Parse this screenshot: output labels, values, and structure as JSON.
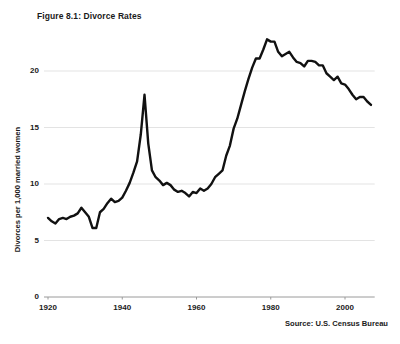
{
  "figure": {
    "title": "Figure 8.1: Divorce Rates",
    "source": "Source: U.S. Census Bureau",
    "background_color": "#ffffff",
    "line_color": "#111111",
    "gridline_color": "#e3e3e3",
    "text_color": "#1a1a1a"
  },
  "chart_data": {
    "type": "line",
    "title": "Figure 8.1: Divorce Rates",
    "xlabel": "",
    "ylabel": "Divorces per 1,000 married women",
    "xlim": [
      1920,
      2008
    ],
    "ylim": [
      0,
      23.5
    ],
    "xticks": [
      1920,
      1940,
      1960,
      1980,
      2000
    ],
    "yticks": [
      0,
      5,
      10,
      15,
      20
    ],
    "xtick_labels": [
      "1920",
      "1940",
      "1960",
      "1980",
      "2000"
    ],
    "ytick_labels": [
      "0",
      "5",
      "10",
      "15",
      "20"
    ],
    "grid": "horizontal",
    "legend": null,
    "annotations": [
      "Source: U.S. Census Bureau"
    ],
    "series": [
      {
        "name": "Divorce rate",
        "x": [
          1920,
          1921,
          1922,
          1923,
          1924,
          1925,
          1926,
          1927,
          1928,
          1929,
          1930,
          1931,
          1932,
          1933,
          1934,
          1935,
          1936,
          1937,
          1938,
          1939,
          1940,
          1941,
          1942,
          1943,
          1944,
          1945,
          1946,
          1947,
          1948,
          1949,
          1950,
          1951,
          1952,
          1953,
          1954,
          1955,
          1956,
          1957,
          1958,
          1959,
          1960,
          1961,
          1962,
          1963,
          1964,
          1965,
          1966,
          1967,
          1968,
          1969,
          1970,
          1971,
          1972,
          1973,
          1974,
          1975,
          1976,
          1977,
          1978,
          1979,
          1980,
          1981,
          1982,
          1983,
          1984,
          1985,
          1986,
          1987,
          1988,
          1989,
          1990,
          1991,
          1992,
          1993,
          1994,
          1995,
          1996,
          1997,
          1998,
          1999,
          2000,
          2001,
          2002,
          2003,
          2004,
          2005,
          2006,
          2007
        ],
        "values": [
          7.0,
          6.7,
          6.5,
          6.9,
          7.0,
          6.9,
          7.1,
          7.2,
          7.4,
          7.9,
          7.5,
          7.1,
          6.1,
          6.1,
          7.5,
          7.8,
          8.3,
          8.7,
          8.4,
          8.5,
          8.8,
          9.4,
          10.1,
          11.0,
          12.0,
          14.4,
          17.9,
          13.6,
          11.2,
          10.6,
          10.3,
          9.9,
          10.1,
          9.9,
          9.5,
          9.3,
          9.4,
          9.2,
          8.9,
          9.3,
          9.2,
          9.6,
          9.4,
          9.6,
          10.0,
          10.6,
          10.9,
          11.2,
          12.5,
          13.4,
          14.9,
          15.8,
          17.0,
          18.2,
          19.3,
          20.3,
          21.1,
          21.1,
          21.9,
          22.8,
          22.6,
          22.6,
          21.7,
          21.3,
          21.5,
          21.7,
          21.2,
          20.8,
          20.7,
          20.4,
          20.9,
          20.9,
          20.8,
          20.5,
          20.5,
          19.8,
          19.5,
          19.2,
          19.5,
          18.9,
          18.8,
          18.4,
          17.9,
          17.5,
          17.7,
          17.7,
          17.3,
          17.0
        ]
      }
    ]
  }
}
